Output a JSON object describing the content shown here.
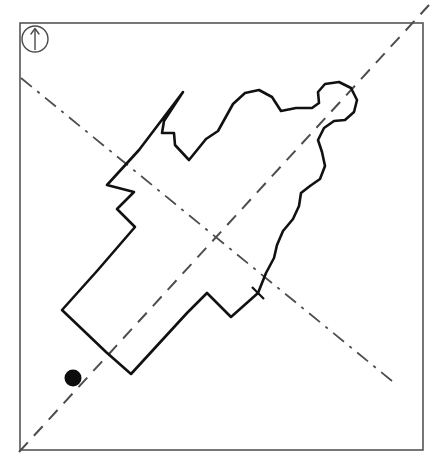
{
  "figure": {
    "background_color": "#ffffff",
    "ink_color": "#1a1a1a",
    "width": 442,
    "height": 459
  },
  "frame": {
    "name": "plot-border",
    "x": 20,
    "y": 23,
    "width": 403,
    "height": 427,
    "stroke_color": "#555555",
    "stroke_width": 1.6
  },
  "north_arrow": {
    "label": "north-arrow",
    "center_x": 35,
    "center_y": 39,
    "radius": 13,
    "stroke_color": "#4a4a4a",
    "stroke_width": 1.4,
    "arrow_top_y": 29,
    "arrow_bottom_y": 50
  },
  "axes": [
    {
      "name": "major-axis",
      "style": "dashed",
      "x1": 19,
      "y1": 452,
      "x2": 429,
      "y2": 5,
      "dash_pattern": "13,9",
      "stroke_color": "#4d4d4d",
      "stroke_width": 2.0
    },
    {
      "name": "minor-axis",
      "style": "dash-dot",
      "x1": 21,
      "y1": 78,
      "x2": 392,
      "y2": 381,
      "dash_pattern": "14,7,3,7",
      "stroke_color": "#4d4d4d",
      "stroke_width": 1.8
    }
  ],
  "axes_intersection": {
    "name": "axis-crossing-point",
    "x": 196,
    "y": 240
  },
  "marker": {
    "name": "origin-dot",
    "shape": "filled-circle",
    "x": 73,
    "y": 378,
    "radius": 8.5,
    "fill_color": "#0d0d0d"
  },
  "tick_mark": {
    "name": "edge-tick",
    "x1": 252,
    "y1": 287,
    "x2": 264,
    "y2": 299,
    "stroke_color": "#111111",
    "stroke_width": 2.2
  },
  "outline": {
    "name": "region-outline",
    "stroke_color": "#111111",
    "stroke_width": 2.6,
    "fill": "none",
    "path": "M 183 92 L 164 121 L 162 133 L 174 133 L 175 145 L 189 160 L 206 139 L 218 131 L 233 104 L 245 93 L 259 90 L 272 97 L 281 111 L 296 108 L 312 108 L 319 103 L 318 92 L 325 84 L 339 82 L 351 88 L 357 100 L 354 112 L 345 120 L 334 121 L 324 128 L 318 140 L 322 152 L 325 166 L 320 179 L 310 186 L 301 193 L 299 206 L 293 219 L 283 231 L 277 245 L 274 258 L 266 273 L 258 293 L 231 317 L 207 293 L 187 313 L 131 374 L 106 352 L 62 310 L 97 271 L 135 227 L 117 209 L 134 192 L 107 185 L 139 150 L 183 92 Z"
  }
}
